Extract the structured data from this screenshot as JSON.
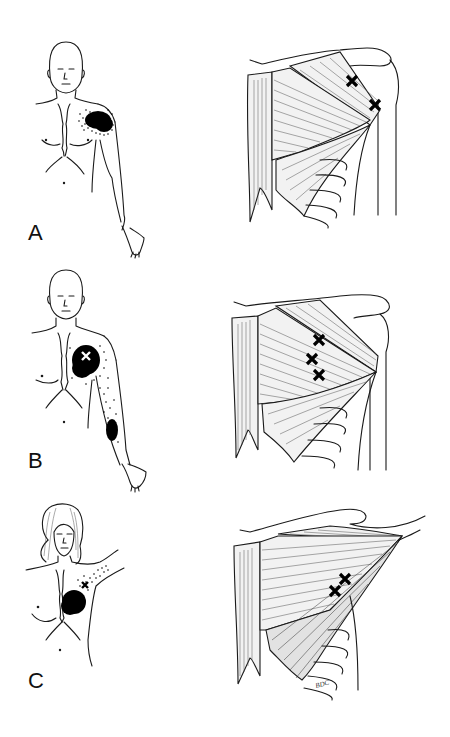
{
  "figure": {
    "panels": [
      {
        "label": "A",
        "body_figure": "male torso, frontal view",
        "pain_region": "anterior shoulder / upper pectoral area",
        "trigger_points_count": 2,
        "trigger_points_location": "clavicular section of pectoralis major"
      },
      {
        "label": "B",
        "body_figure": "male torso, frontal view",
        "pain_region": "anterior chest with spillover down medial arm to forearm",
        "trigger_points_count": 3,
        "trigger_points_location": "sternal section of pectoralis major"
      },
      {
        "label": "C",
        "body_figure": "female torso with raised arm",
        "pain_region": "breast area with spillover into axilla",
        "trigger_points_count": 2,
        "trigger_points_location": "lateral free margin of pectoralis major"
      }
    ],
    "signature": "BDC",
    "colors": {
      "ink": "#1a1a1a",
      "background": "#ffffff",
      "muscle_fill": "#f2f2f2",
      "pain_fill": "#000000"
    }
  }
}
